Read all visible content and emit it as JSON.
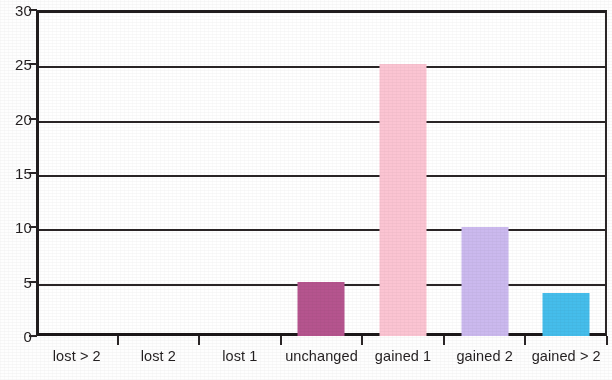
{
  "chart_data": {
    "type": "bar",
    "title": "",
    "subtitle": "",
    "xlabel": "",
    "ylabel": "",
    "categories": [
      "lost > 2",
      "lost 2",
      "lost 1",
      "unchanged",
      "gained 1",
      "gained 2",
      "gained > 2"
    ],
    "values": [
      0,
      0,
      0,
      5,
      25,
      10,
      4
    ],
    "colors": [
      "#b5548e",
      "#b5548e",
      "#b5548e",
      "#b5548e",
      "#fbc4d2",
      "#cbb9ee",
      "#45bdeb"
    ],
    "ylim": [
      0,
      30
    ],
    "y_ticks": [
      0,
      5,
      10,
      15,
      20,
      25,
      30
    ],
    "y_tick_labels": [
      "0",
      "5",
      "10",
      "15",
      "20",
      "25",
      "30"
    ],
    "grid": true,
    "grid_axis": "y",
    "legend": false,
    "legend_position": "none",
    "annotations": []
  },
  "palette": {
    "axis": "#2a2526",
    "text": "#231f20",
    "background": "#ffffff",
    "bar_mauve": "#b5548e",
    "bar_pink": "#fbc4d2",
    "bar_lavender": "#cbb9ee",
    "bar_blue": "#45bdeb"
  }
}
